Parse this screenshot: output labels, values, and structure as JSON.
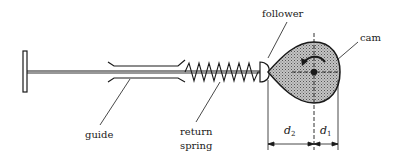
{
  "diagram": {
    "type": "mechanism",
    "colors": {
      "ink": "#1a1a1a",
      "cam_fill": "#a8a8a8",
      "background": "#ffffff"
    },
    "labels": {
      "follower": "follower",
      "cam": "cam",
      "guide": "guide",
      "return_spring_line1": "return",
      "return_spring_line2": "spring"
    },
    "dimensions": {
      "d2": {
        "symbol": "d",
        "subscript": "2"
      },
      "d1": {
        "symbol": "d",
        "subscript": "1"
      }
    },
    "components": [
      {
        "name": "handle",
        "shape": "T-bar end"
      },
      {
        "name": "rod"
      },
      {
        "name": "guide",
        "shape": "sleeve with flared ends"
      },
      {
        "name": "return spring",
        "shape": "zigzag coil"
      },
      {
        "name": "follower",
        "shape": "rounded tip"
      },
      {
        "name": "cam",
        "shape": "pear-shaped, shaded",
        "rotation_arrow": "counter-clockwise"
      }
    ]
  }
}
